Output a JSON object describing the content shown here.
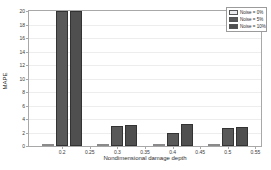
{
  "figure": {
    "background": "#ffffff",
    "axes_box_color": "#a8a8a8",
    "grid_color": "#ededed"
  },
  "chart_data": {
    "type": "bar",
    "title": "",
    "xlabel": "Nondimensional damage depth",
    "ylabel": "MAPE",
    "categories": [
      0.2,
      0.3,
      0.4,
      0.5
    ],
    "series": [
      {
        "name": "Noise = 0%",
        "color": "#ebebeb",
        "edge": "#8a8a8a",
        "values": [
          0.15,
          0.25,
          0.2,
          0.15
        ]
      },
      {
        "name": "Noise = 5%",
        "color": "#595959",
        "edge": "#333333",
        "values": [
          20.0,
          3.0,
          2.0,
          2.6
        ]
      },
      {
        "name": "Noise = 10%",
        "color": "#4f4f4f",
        "edge": "#333333",
        "values": [
          20.0,
          3.1,
          3.3,
          2.8
        ]
      }
    ],
    "xtick_labels": [
      "0.2",
      "0.25",
      "0.3",
      "0.35",
      "0.4",
      "0.45",
      "0.5",
      "0.55"
    ],
    "xtick_values": [
      0.2,
      0.25,
      0.3,
      0.35,
      0.4,
      0.45,
      0.5,
      0.55
    ],
    "xlim": [
      0.14,
      0.56
    ],
    "ytick_labels": [
      "0",
      "2",
      "4",
      "6",
      "8",
      "10",
      "12",
      "14",
      "16",
      "18",
      "20"
    ],
    "ytick_values": [
      0,
      2,
      4,
      6,
      8,
      10,
      12,
      14,
      16,
      18,
      20
    ],
    "ylim": [
      0,
      20
    ],
    "grid": true,
    "legend_position": "top-right",
    "note": "Bars of the two dark series at category 0.2 reach the top of the axes (clipped at 20)"
  }
}
